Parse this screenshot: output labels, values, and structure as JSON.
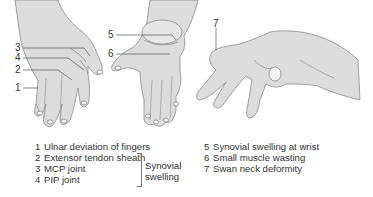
{
  "figure": {
    "colors": {
      "skin": "#dcdcdc",
      "skin_shadow": "#c9c9c9",
      "outline": "#8a8a8a",
      "leader_line": "#555555",
      "text": "#333333"
    }
  },
  "callouts": [
    {
      "num": "1"
    },
    {
      "num": "2"
    },
    {
      "num": "3"
    },
    {
      "num": "4"
    },
    {
      "num": "5"
    },
    {
      "num": "6"
    },
    {
      "num": "7"
    }
  ],
  "legend": {
    "left": [
      {
        "num": "1",
        "label": "Ulnar deviation of fingers"
      },
      {
        "num": "2",
        "label": "Extensor tendon sheath"
      },
      {
        "num": "3",
        "label": "MCP joint"
      },
      {
        "num": "4",
        "label": "PIP joint"
      }
    ],
    "bracket_label_line1": "Synovial",
    "bracket_label_line2": "swelling",
    "right": [
      {
        "num": "5",
        "label": "Synovial swelling at wrist"
      },
      {
        "num": "6",
        "label": "Small muscle wasting"
      },
      {
        "num": "7",
        "label": "Swan neck deformity"
      }
    ]
  }
}
